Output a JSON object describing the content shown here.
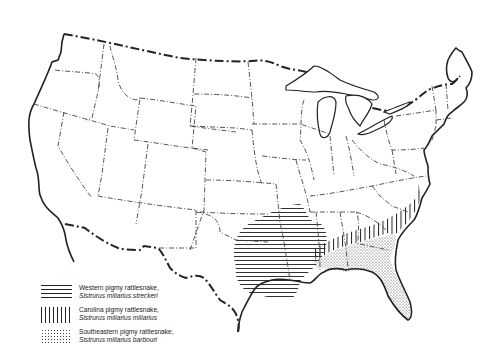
{
  "map": {
    "title": "Range of pigmy rattlesnake subspecies in the United States",
    "region": "Contiguous United States",
    "colors": {
      "ink": "#222222",
      "background": "#ffffff"
    }
  },
  "legend": {
    "items": [
      {
        "pattern": "horizontal-lines",
        "common_name": "Western pigmy rattlesnake,",
        "scientific_name": "Sistrurus miliarius streckeri"
      },
      {
        "pattern": "vertical-lines",
        "common_name": "Carolina pigmy rattlesnake,",
        "scientific_name": "Sistrurus miliarius miliarius"
      },
      {
        "pattern": "stipple-dots",
        "common_name": "Southeastern pigmy rattlesnake,",
        "scientific_name": "Sistrurus miliarius barbouri"
      }
    ]
  }
}
